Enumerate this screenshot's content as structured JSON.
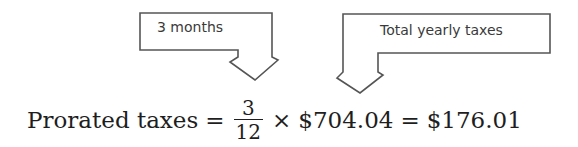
{
  "callouts": [
    {
      "id": "months",
      "label": "3 months",
      "points_to": "fraction numerator"
    },
    {
      "id": "yearly",
      "label": "Total yearly taxes",
      "points_to": "$704.04"
    }
  ],
  "equation": {
    "lhs": "Prorated taxes",
    "equals_1": "=",
    "fraction": {
      "numerator": "3",
      "denominator": "12"
    },
    "times": "×",
    "amount": "$704.04",
    "equals_2": "=",
    "result": "$176.01"
  },
  "colors": {
    "line": "#555555",
    "text": "#1e1e1e"
  }
}
